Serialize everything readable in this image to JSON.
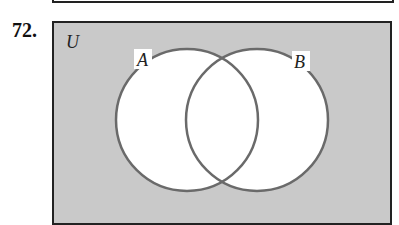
{
  "problem": {
    "number": "72."
  },
  "diagram": {
    "universe_label": "U",
    "sets": [
      {
        "label": "A",
        "cx": 187,
        "cy": 120,
        "r": 71
      },
      {
        "label": "B",
        "cx": 257,
        "cy": 120,
        "r": 71
      }
    ],
    "shaded_region": "complement of A ∪ B",
    "colors": {
      "shade": "#c9c9c9",
      "circle_stroke": "#6a6a6a",
      "border": "#222222",
      "interior": "#ffffff"
    }
  }
}
